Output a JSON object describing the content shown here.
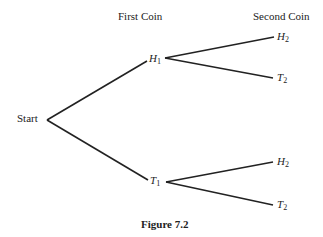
{
  "headers": {
    "first": "First Coin",
    "second": "Second Coin"
  },
  "nodes": {
    "start": "Start",
    "h1": {
      "letter": "H",
      "sub": "1"
    },
    "t1": {
      "letter": "T",
      "sub": "1"
    },
    "h1_h2": {
      "letter": "H",
      "sub": "2"
    },
    "h1_t2": {
      "letter": "T",
      "sub": "2"
    },
    "t1_h2": {
      "letter": "H",
      "sub": "2"
    },
    "t1_t2": {
      "letter": "T",
      "sub": "2"
    }
  },
  "caption": "Figure 7.2",
  "line_color": "#222222"
}
